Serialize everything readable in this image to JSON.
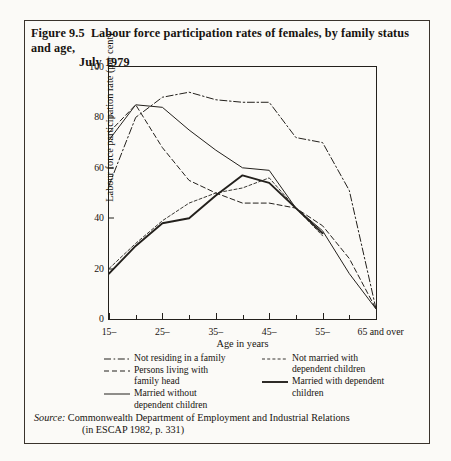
{
  "running_head": {
    "text": "",
    "page": ""
  },
  "figure": {
    "number": "Figure 9.5",
    "title_line1": "Labour force participation rates of females, by family status and age,",
    "title_line2": "July 1979"
  },
  "source": {
    "label": "Source:",
    "line1": "Commonwealth Department of Employment and Industrial Relations",
    "line2": "(in ESCAP 1982, p. 331)"
  },
  "legend": {
    "items": [
      {
        "label_line1": "Not residing in a family",
        "label_line2": "",
        "style": "dash-dot",
        "column": "left"
      },
      {
        "label_line1": "Persons living with",
        "label_line2": "family head",
        "style": "dashed",
        "column": "left"
      },
      {
        "label_line1": "Married without",
        "label_line2": "dependent children",
        "style": "solid-thin",
        "column": "left"
      },
      {
        "label_line1": "Not married with",
        "label_line2": "dependent children",
        "style": "fine-dashed",
        "column": "right"
      },
      {
        "label_line1": "Married with dependent",
        "label_line2": "children",
        "style": "solid-thick",
        "column": "right"
      }
    ]
  },
  "chart_data": {
    "type": "line",
    "title": "Labour force participation rates of females, by family status and age, July 1979",
    "xlabel": "Age in years",
    "ylabel": "Labour force participation rate (per cent)",
    "categories": [
      "15–",
      "25–",
      "35–",
      "45–",
      "55–",
      "65 and over"
    ],
    "xticklabels": [
      "15–",
      "25–",
      "35–",
      "45–",
      "55–",
      "65 and over"
    ],
    "yticklabels": [
      "0",
      "20",
      "40",
      "60",
      "80",
      "100"
    ],
    "ylim": [
      0,
      100
    ],
    "ytick_values": [
      0,
      20,
      40,
      60,
      80,
      100
    ],
    "grid": false,
    "legend_position": "below-axes",
    "x_positions": [
      15,
      20,
      25,
      30,
      35,
      40,
      45,
      50,
      55,
      60,
      65
    ],
    "series": [
      {
        "name": "Not residing in a family",
        "style": "dash-dot",
        "x": [
          15,
          20,
          25,
          30,
          35,
          40,
          45,
          50,
          55,
          60,
          65
        ],
        "values": [
          53,
          80,
          88,
          90,
          87,
          86,
          86,
          72,
          70,
          51,
          4
        ]
      },
      {
        "name": "Persons living with family head",
        "style": "dashed",
        "x": [
          15,
          20,
          25,
          30,
          35,
          40,
          45,
          50,
          55,
          60,
          65
        ],
        "values": [
          74,
          85,
          68,
          55,
          50,
          46,
          46,
          44,
          37,
          24,
          4
        ]
      },
      {
        "name": "Married without dependent children",
        "style": "solid-thin",
        "x": [
          15,
          20,
          25,
          30,
          35,
          40,
          45,
          50,
          55,
          60,
          65
        ],
        "values": [
          71,
          85,
          84,
          75,
          67,
          60,
          59,
          44,
          35,
          18,
          4
        ]
      },
      {
        "name": "Not married with dependent children",
        "style": "fine-dashed",
        "x": [
          15,
          20,
          25,
          30,
          35,
          40,
          45,
          50,
          55
        ],
        "values": [
          20,
          30,
          39,
          46,
          50,
          52,
          56,
          44,
          33
        ]
      },
      {
        "name": "Married with dependent children",
        "style": "solid-thick",
        "x": [
          15,
          20,
          25,
          30,
          35,
          40,
          45,
          50,
          55
        ],
        "values": [
          18,
          29,
          38,
          40,
          49,
          57,
          54,
          44,
          34
        ]
      }
    ]
  }
}
